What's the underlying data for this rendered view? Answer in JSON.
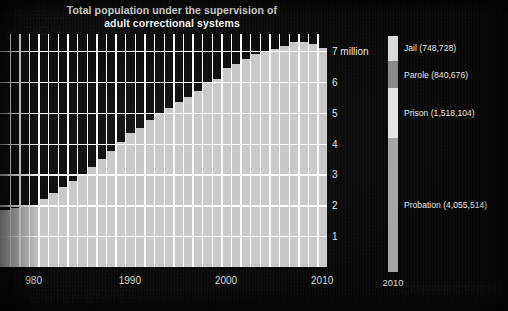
{
  "title": "Total population under the supervision of\nadult correctional systems",
  "title_line1": "Total population under the supervision of",
  "title_line2": "adult correctional systems",
  "colors": {
    "background": "#0a0a0a",
    "bar": "#c9c9c9",
    "gridline": "#fdfdfd",
    "text": "#e8e8e8",
    "jail": "#d9d9d9",
    "parole": "#8a8a8a",
    "prison": "#e4e4e4",
    "probation": "#a6a6a6"
  },
  "axes": {
    "y_unit_label": "7 million",
    "y_ticks": [
      "1",
      "2",
      "3",
      "4",
      "5",
      "6",
      "7 million"
    ],
    "y_values": [
      1,
      2,
      3,
      4,
      5,
      6,
      7
    ],
    "ylim": [
      0,
      7.55
    ],
    "x_ticks": [
      "980",
      "1990",
      "2000",
      "2010"
    ],
    "x_tick_values": [
      1980,
      1990,
      2000,
      2010
    ],
    "xlim": [
      1976.5,
      2010.5
    ]
  },
  "legend": {
    "year_label": "2010",
    "items": [
      {
        "label": "Jail (748,728)",
        "name": "Jail",
        "value": 748728,
        "color": "#d9d9d9"
      },
      {
        "label": "Parole (840,676)",
        "name": "Parole",
        "value": 840676,
        "color": "#8a8a8a"
      },
      {
        "label": "Prison (1,518,104)",
        "name": "Prison",
        "value": 1518104,
        "color": "#e4e4e4"
      },
      {
        "label": "Probation (4,055,514)",
        "name": "Probation",
        "value": 4055514,
        "color": "#a6a6a6"
      }
    ]
  },
  "chart_data": {
    "type": "bar",
    "title": "Total population under the supervision of adult correctional systems",
    "xlabel": "",
    "ylabel": "7 million",
    "ylim": [
      0,
      7.55
    ],
    "grid": true,
    "legend_position": "right",
    "categories": [
      "1977",
      "1978",
      "1979",
      "1980",
      "1981",
      "1982",
      "1983",
      "1984",
      "1985",
      "1986",
      "1987",
      "1988",
      "1989",
      "1990",
      "1991",
      "1992",
      "1993",
      "1994",
      "1995",
      "1996",
      "1997",
      "1998",
      "1999",
      "2000",
      "2001",
      "2002",
      "2003",
      "2004",
      "2005",
      "2006",
      "2007",
      "2008",
      "2009",
      "2010"
    ],
    "values": [
      1.85,
      1.9,
      1.95,
      2.0,
      2.2,
      2.4,
      2.58,
      2.8,
      3.0,
      3.25,
      3.5,
      3.75,
      4.05,
      4.35,
      4.5,
      4.75,
      4.95,
      5.15,
      5.35,
      5.5,
      5.7,
      5.95,
      6.1,
      6.45,
      6.58,
      6.75,
      6.9,
      7.0,
      7.05,
      7.15,
      7.3,
      7.3,
      7.22,
      7.1
    ],
    "annotations": [
      "Peak around 2007–2008 at approximately 7.3 million",
      "2010 composition: Probation 4,055,514; Prison 1,518,104; Parole 840,676; Jail 748,728"
    ],
    "legend_entries": [
      "Jail (748,728)",
      "Parole (840,676)",
      "Prison (1,518,104)",
      "Probation (4,055,514)"
    ]
  }
}
